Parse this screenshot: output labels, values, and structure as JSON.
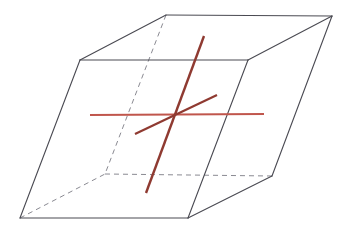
{
  "figure": {
    "canvas": {
      "width": 352,
      "height": 236,
      "background": "#ffffff"
    }
  },
  "colors": {
    "edge_visible": "#4a4a52",
    "edge_hidden": "#8a8a92",
    "axis_light_red": "#c0564c",
    "axis_dark_red": "#8f3a31",
    "face": "#ffffff",
    "background": "#ffffff"
  },
  "solid": {
    "name": "parallelepiped",
    "vertices": {
      "front_top_left": {
        "x": 80,
        "y": 60,
        "label": "A"
      },
      "front_top_right": {
        "x": 248,
        "y": 60,
        "label": "B"
      },
      "back_top_right": {
        "x": 332,
        "y": 16,
        "label": "C"
      },
      "back_top_left": {
        "x": 166,
        "y": 15,
        "label": "D"
      },
      "front_bottom_left": {
        "x": 20,
        "y": 218,
        "label": "E"
      },
      "front_bottom_right": {
        "x": 188,
        "y": 218,
        "label": "F"
      },
      "back_bottom_right": {
        "x": 272,
        "y": 176,
        "label": "G"
      },
      "back_bottom_left": {
        "x": 105,
        "y": 174,
        "label": "H"
      }
    },
    "visible_edges": [
      {
        "name": "top-front",
        "from": "front_top_left",
        "to": "front_top_right"
      },
      {
        "name": "top-right",
        "from": "front_top_right",
        "to": "back_top_right"
      },
      {
        "name": "top-back",
        "from": "back_top_right",
        "to": "back_top_left"
      },
      {
        "name": "top-left",
        "from": "back_top_left",
        "to": "front_top_left"
      },
      {
        "name": "left-vert",
        "from": "front_top_left",
        "to": "front_bottom_left"
      },
      {
        "name": "right-vert",
        "from": "front_top_right",
        "to": "front_bottom_right"
      },
      {
        "name": "far-vert",
        "from": "back_top_right",
        "to": "back_bottom_right"
      },
      {
        "name": "bottom-front",
        "from": "front_bottom_left",
        "to": "front_bottom_right"
      },
      {
        "name": "bottom-right",
        "from": "front_bottom_right",
        "to": "back_bottom_right"
      }
    ],
    "hidden_edges": [
      {
        "name": "hidden-vert-back-left",
        "from": "back_top_left",
        "to": "back_bottom_left"
      },
      {
        "name": "hidden-bottom-back",
        "from": "back_bottom_left",
        "to": "back_bottom_right"
      },
      {
        "name": "hidden-bottom-left-diag",
        "from": "front_bottom_left",
        "to": "back_bottom_left"
      }
    ],
    "stroke_width_visible": 1.1,
    "stroke_width_hidden": 1.0,
    "hidden_dash_pattern": "5,4"
  },
  "axes": {
    "intersection": {
      "x": 176,
      "y": 114
    },
    "lines": [
      {
        "name": "horizontal-axis",
        "x1": 90,
        "y1": 115,
        "x2": 264,
        "y2": 114,
        "color": "#c0564c",
        "width": 2.2,
        "orientation": "horizontal"
      },
      {
        "name": "steep-axis",
        "x1": 204,
        "y1": 36,
        "x2": 146,
        "y2": 193,
        "color": "#8f3a31",
        "width": 2.4,
        "orientation": "steep-descending"
      },
      {
        "name": "shallow-diagonal-axis",
        "x1": 135,
        "y1": 134,
        "x2": 217,
        "y2": 95,
        "color": "#8f3a31",
        "width": 2.2,
        "orientation": "shallow-ascending"
      }
    ]
  }
}
